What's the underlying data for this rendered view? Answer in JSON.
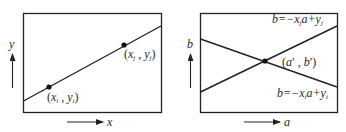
{
  "figure": {
    "left_panel": {
      "name": "data-space",
      "axes": {
        "x_label": "x",
        "y_label": "y"
      },
      "line": {
        "from": [
          23,
          101
        ],
        "to": [
          161,
          26
        ]
      },
      "points": [
        {
          "id": "pi",
          "label_open": "(",
          "var1": "x",
          "sub1": "i",
          "comma": " , ",
          "var2": "y",
          "sub2": "i",
          "label_close": ")",
          "pos": [
            49,
            87
          ]
        },
        {
          "id": "pj",
          "label_open": "(",
          "var1": "x",
          "sub1": "j",
          "comma": " , ",
          "var2": "y",
          "sub2": "j",
          "label_close": ")",
          "pos": [
            124,
            45
          ]
        }
      ]
    },
    "right_panel": {
      "name": "parameter-space",
      "axes": {
        "x_label": "a",
        "y_label": "b"
      },
      "lines": [
        {
          "id": "line-j",
          "eq_prefix": "b=−x",
          "eq_sub": "j",
          "eq_mid": "a+y",
          "eq_sub2": "j",
          "from": [
            200,
            92
          ],
          "to": [
            337,
            26
          ]
        },
        {
          "id": "line-i",
          "eq_prefix": "b=−x",
          "eq_sub": "i",
          "eq_mid": "a+y",
          "eq_sub2": "i",
          "from": [
            200,
            39
          ],
          "to": [
            337,
            87
          ]
        }
      ],
      "intersection": {
        "label": "(a′ , b′)",
        "pos": [
          265,
          61
        ]
      }
    },
    "colors": {
      "stroke": "#222222",
      "point": "#111111",
      "text": "#2a2a2a",
      "background": "#ffffff"
    }
  }
}
